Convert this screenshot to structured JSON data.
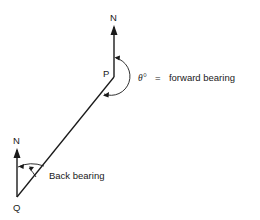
{
  "diagram": {
    "type": "bearing-diagram",
    "points": {
      "P": {
        "label": "P"
      },
      "Q": {
        "label": "Q"
      }
    },
    "north_labels": {
      "top": "N",
      "bottom": "N"
    },
    "annotations": {
      "forward_symbol": "θ°",
      "forward_eq": "=",
      "forward_text": "forward bearing",
      "back_text": "Back bearing"
    },
    "colors": {
      "line": "#1a1a1a",
      "background": "#ffffff"
    }
  }
}
